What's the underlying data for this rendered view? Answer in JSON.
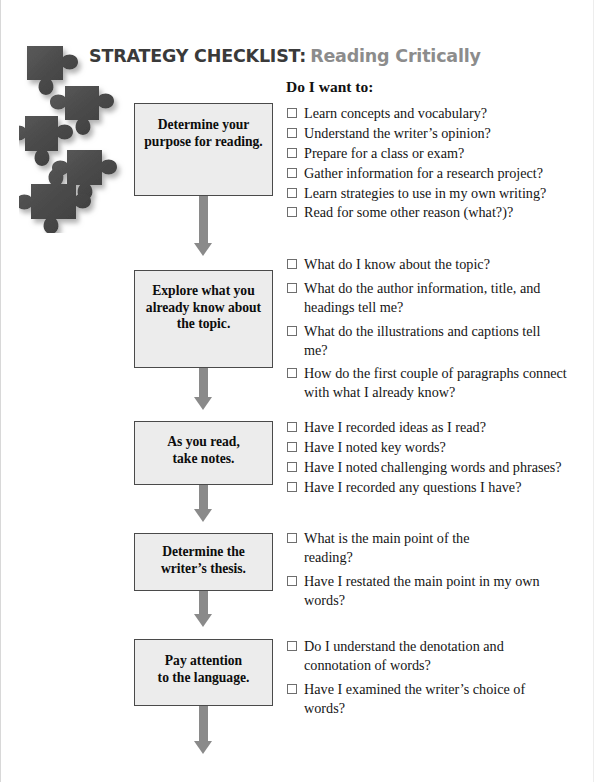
{
  "header": {
    "title_main": "STRATEGY CHECKLIST:",
    "title_sub": "Reading Critically",
    "title_main_color": "#3a3a3a",
    "title_sub_color": "#8c8c8c",
    "prompt": "Do I want to:"
  },
  "decoration": {
    "puzzle_pieces_count": 5,
    "puzzle_color": "#4d4d4d"
  },
  "steps": [
    {
      "box_label": "Determine your\npurpose for reading.",
      "items": [
        "Learn concepts and vocabulary?",
        "Understand the writer’s opinion?",
        "Prepare for a class or exam?",
        "Gather information for a research project?",
        "Learn strategies to use in my own writing?",
        "Read for some other reason (what?)?"
      ]
    },
    {
      "box_label": "Explore what you\nalready know about\nthe topic.",
      "items": [
        "What do I know about the topic?",
        "What do the author information, title, and headings tell me?",
        "What do the illustrations and captions tell me?",
        "How do the first couple of paragraphs connect with what I already know?"
      ]
    },
    {
      "box_label": "As you read,\ntake notes.",
      "items": [
        "Have I recorded ideas as I read?",
        "Have I noted key words?",
        "Have I noted challenging words and phrases?",
        "Have I recorded any questions I have?"
      ]
    },
    {
      "box_label": "Determine the\nwriter’s thesis.",
      "items": [
        "What is the main point of the reading?",
        "Have I restated the main point in my own words?"
      ]
    },
    {
      "box_label": "Pay attention\nto the language.",
      "items": [
        "Do I understand the denotation and connotation of words?",
        "Have I examined the writer’s choice of words?"
      ]
    }
  ],
  "colors": {
    "box_fill": "#ececec",
    "box_border": "#4a4a4a",
    "arrow": "#8a8a8a",
    "checkbox_border": "#6e6e6e",
    "text": "#151515"
  }
}
